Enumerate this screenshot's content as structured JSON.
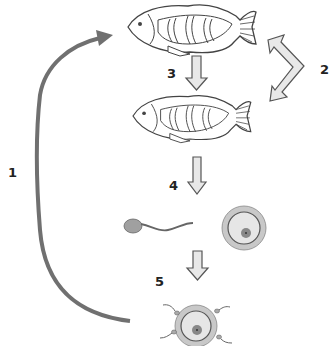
{
  "labels": {
    "step1": "1",
    "step2": "2",
    "step3": "3",
    "step4": "4",
    "step5": "5"
  },
  "colors": {
    "cycle_arrow": "#707070",
    "block_arrow_fill": "#e8e8e8",
    "outline": "#555555",
    "egg_outer": "#c8c8c8",
    "egg_inner": "#e6e6e6",
    "nucleus": "#888888",
    "sperm_head": "#a0a0a0"
  },
  "diagram": {
    "nodes": [
      "adult fish",
      "adult fish (mature)",
      "sperm",
      "egg",
      "fertilized egg"
    ],
    "edges": [
      {
        "from": "adult fish",
        "to": "adult fish (mature)",
        "label": "3"
      },
      {
        "from": "adult fish (mature)",
        "to": "sperm and egg",
        "label": "4"
      },
      {
        "from": "sperm and egg",
        "to": "fertilized egg",
        "label": "5"
      },
      {
        "from": "fertilized egg",
        "to": "adult fish",
        "label": "1"
      },
      {
        "between": "adult fishes",
        "type": "double-arrow",
        "label": "2"
      }
    ]
  }
}
